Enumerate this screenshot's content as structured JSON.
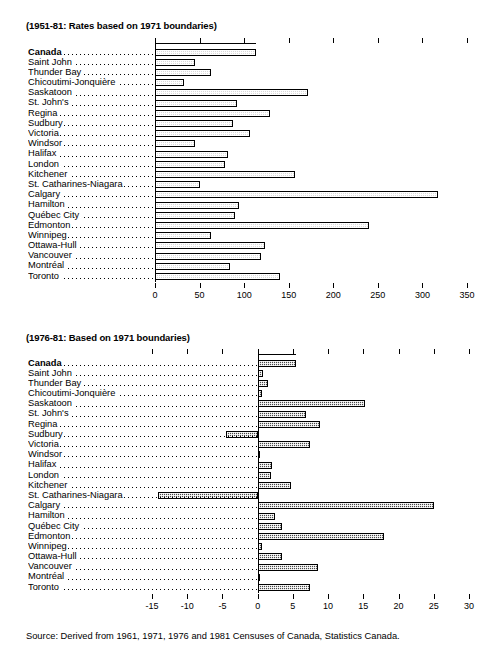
{
  "chart_data": [
    {
      "type": "bar",
      "orientation": "horizontal",
      "title": "(1951-81: Rates based on 1971 boundaries)",
      "xlabel": "",
      "ylabel": "",
      "xlim": [
        0,
        350
      ],
      "xticks": [
        0,
        50,
        100,
        150,
        200,
        250,
        300,
        350
      ],
      "grid": false,
      "legend": "none",
      "categories": [
        "Canada",
        "Saint John",
        "Thunder Bay",
        "Chicoutimi-Jonquière",
        "Saskatoon",
        "St. John's",
        "Regina",
        "Sudbury",
        "Victoria",
        "Windsor",
        "Halifax",
        "London",
        "Kitchener",
        "St. Catharines-Niagara",
        "Calgary",
        "Hamilton",
        "Québec City",
        "Edmonton",
        "Winnipeg",
        "Ottawa-Hull",
        "Vancouver",
        "Montréal",
        "Toronto"
      ],
      "values": [
        113,
        45,
        63,
        32,
        172,
        92,
        129,
        88,
        107,
        45,
        82,
        79,
        157,
        50,
        318,
        94,
        90,
        240,
        63,
        123,
        119,
        84,
        140
      ]
    },
    {
      "type": "bar",
      "orientation": "horizontal",
      "title": "(1976-81: Based on 1971 boundaries)",
      "xlabel": "",
      "ylabel": "",
      "xlim": [
        -15,
        30
      ],
      "xticks": [
        -15,
        -10,
        -5,
        0,
        5,
        10,
        15,
        20,
        25,
        30
      ],
      "grid": false,
      "legend": "none",
      "categories": [
        "Canada",
        "Saint John",
        "Thunder Bay",
        "Chicoutimi-Jonquière",
        "Saskatoon",
        "St. John's",
        "Regina",
        "Sudbury",
        "Victoria",
        "Windsor",
        "Halifax",
        "London",
        "Kitchener",
        "St. Catharines-Niagara",
        "Calgary",
        "Hamilton",
        "Québec City",
        "Edmonton",
        "Winnipeg",
        "Ottawa-Hull",
        "Vancouver",
        "Montréal",
        "Toronto"
      ],
      "values": [
        5.5,
        0.7,
        1.4,
        0.6,
        15.3,
        6.8,
        8.8,
        -4.5,
        7.4,
        0.2,
        2.1,
        1.9,
        4.7,
        -14.2,
        25.1,
        2.4,
        3.5,
        18.0,
        0.6,
        3.4,
        8.5,
        0.4,
        7.4
      ]
    }
  ],
  "footer": {
    "source": "Source: Derived from 1961, 1971, 1976 and 1981 Censuses of Canada, Statistics Canada."
  }
}
